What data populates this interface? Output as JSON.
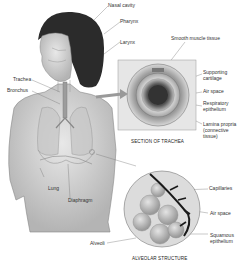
{
  "diagram": {
    "labels": {
      "nasal_cavity": "Nasal cavity",
      "pharynx": "Pharynx",
      "larynx": "Larynx",
      "trachea": "Trachea",
      "bronchus": "Bronchus",
      "lung": "Lung",
      "diaphragm": "Diaphragm",
      "alveoli": "Alveoli"
    },
    "trachea_section": {
      "caption": "SECTION OF TRACHEA",
      "labels": {
        "smooth_muscle": "Smooth muscle tissue",
        "cartilage_1": "Supporting",
        "cartilage_2": "cartilage",
        "air_space": "Air space",
        "epithelium_1": "Respiratory",
        "epithelium_2": "epithelium",
        "lamina_1": "Lamina propria",
        "lamina_2": "(connective",
        "lamina_3": "tissue)"
      }
    },
    "alveolar_structure": {
      "caption": "ALVEOLAR STRUCTURE",
      "labels": {
        "capillaries": "Capillaries",
        "air_space": "Air space",
        "squamous_1": "Squamous",
        "squamous_2": "epithelium"
      }
    }
  }
}
